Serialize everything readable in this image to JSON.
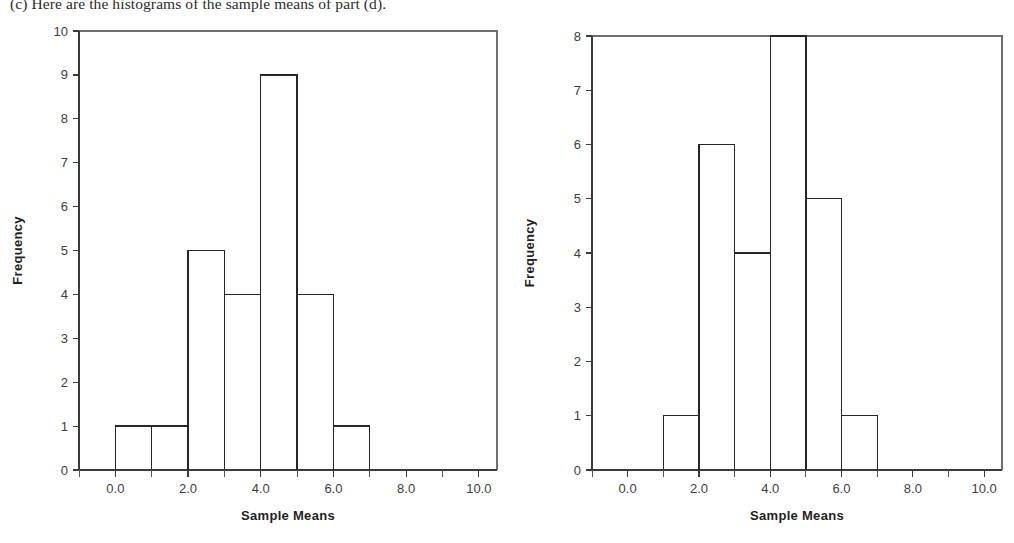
{
  "caption": {
    "text": "(c) Here are the histograms of the sample means of part (d)."
  },
  "charts": {
    "left": {
      "name": "left-histogram",
      "ylabel": "Frequency",
      "xlabel": "Sample Means",
      "ytick_labels": [
        "0",
        "1",
        "2",
        "3",
        "4",
        "5",
        "6",
        "7",
        "8",
        "9",
        "10"
      ],
      "xtick_labels": [
        "0.0",
        "2.0",
        "4.0",
        "6.0",
        "8.0",
        "10.0"
      ]
    },
    "right": {
      "name": "right-histogram",
      "ylabel": "Frequency",
      "xlabel": "Sample Means",
      "ytick_labels": [
        "0",
        "1",
        "2",
        "3",
        "4",
        "5",
        "6",
        "7",
        "8"
      ],
      "xtick_labels": [
        "0.0",
        "2.0",
        "4.0",
        "6.0",
        "8.0",
        "10.0"
      ]
    }
  },
  "chart_data": [
    {
      "type": "bar",
      "title": "",
      "xlabel": "Sample Means",
      "ylabel": "Frequency",
      "xlim": [
        -1.0,
        10.5
      ],
      "ylim": [
        0,
        10
      ],
      "ytick_values": [
        0,
        1,
        2,
        3,
        4,
        5,
        6,
        7,
        8,
        9,
        10
      ],
      "xtick_values": [
        0.0,
        2.0,
        4.0,
        6.0,
        8.0,
        10.0
      ],
      "xtick_minor_values": [
        -1.0,
        1.0,
        3.0,
        5.0,
        7.0,
        9.0
      ],
      "grid": false,
      "legend": "none",
      "bin_edges": [
        0,
        1,
        2,
        3,
        4,
        5,
        6,
        7
      ],
      "categories": [
        "0-1",
        "1-2",
        "2-3",
        "3-4",
        "4-5",
        "5-6",
        "6-7"
      ],
      "values": [
        1,
        1,
        5,
        4,
        9,
        4,
        1
      ]
    },
    {
      "type": "bar",
      "title": "",
      "xlabel": "Sample Means",
      "ylabel": "Frequency",
      "xlim": [
        -1.0,
        10.5
      ],
      "ylim": [
        0,
        8
      ],
      "ytick_values": [
        0,
        1,
        2,
        3,
        4,
        5,
        6,
        7,
        8
      ],
      "xtick_values": [
        0.0,
        2.0,
        4.0,
        6.0,
        8.0,
        10.0
      ],
      "xtick_minor_values": [
        -1.0,
        1.0,
        3.0,
        5.0,
        7.0,
        9.0
      ],
      "grid": false,
      "legend": "none",
      "bin_edges": [
        1,
        2,
        3,
        4,
        5,
        6,
        7
      ],
      "categories": [
        "1-2",
        "2-3",
        "3-4",
        "4-5",
        "5-6",
        "6-7"
      ],
      "values": [
        1,
        6,
        4,
        8,
        5,
        1
      ]
    }
  ]
}
